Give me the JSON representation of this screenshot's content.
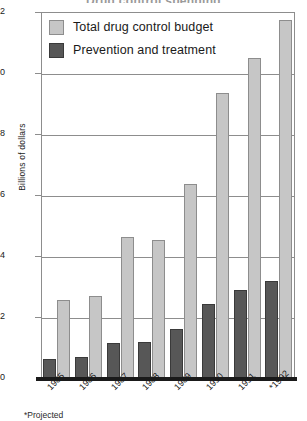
{
  "chart_data": {
    "type": "bar",
    "title": "Drug control spending",
    "subtitle": "",
    "xlabel": "",
    "ylabel": "Billions of dollars",
    "categories": [
      "1985",
      "1986",
      "1987",
      "1988",
      "1989",
      "1990",
      "1991",
      "*1992"
    ],
    "series": [
      {
        "name": "Total drug control budget",
        "color": "#c6c6c6",
        "values": [
          2.55,
          2.7,
          4.62,
          4.52,
          6.35,
          9.35,
          10.5,
          11.75
        ]
      },
      {
        "name": "Prevention and treatment",
        "color": "#575757",
        "values": [
          0.62,
          0.68,
          1.15,
          1.18,
          1.6,
          2.43,
          2.88,
          3.18
        ]
      }
    ],
    "ylim": [
      0,
      12
    ],
    "yticks": [
      "0",
      "2",
      "4",
      "6",
      "8",
      "10",
      "12"
    ],
    "ytick_values": [
      0,
      2,
      4,
      6,
      8,
      10,
      12
    ],
    "grid": true,
    "legend_position": "top-left",
    "annotations": [
      "*Projected"
    ]
  },
  "legend": {
    "items": [
      {
        "label": "Total drug control budget",
        "swatch": "light"
      },
      {
        "label": "Prevention and treatment",
        "swatch": "dark"
      }
    ]
  },
  "footnote": "*Projected"
}
